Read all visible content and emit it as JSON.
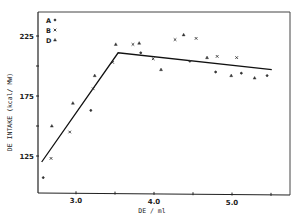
{
  "chart_data": {
    "type": "scatter",
    "title": "",
    "xlabel": "DE / ml",
    "ylabel": "DE INTAKE (kcal/ MW)",
    "xlim": [
      2.5,
      5.65
    ],
    "ylim": [
      96,
      244
    ],
    "x_ticks": [
      3.0,
      3.5,
      4.0,
      4.5,
      5.0,
      5.5
    ],
    "x_tick_labels": [
      "3.0",
      "",
      "4.0",
      "",
      "5.0",
      ""
    ],
    "y_ticks": [
      125,
      150,
      175,
      200,
      225
    ],
    "y_tick_labels": [
      "125",
      "",
      "175",
      "",
      "225"
    ],
    "grid": false,
    "legend_position": "upper-left",
    "legend": [
      {
        "label": "A",
        "marker": "dot"
      },
      {
        "label": "B",
        "marker": "cross"
      },
      {
        "label": "D",
        "marker": "triangle"
      }
    ],
    "series": [
      {
        "name": "A",
        "marker": "dot",
        "points": [
          [
            2.58,
            107
          ],
          [
            3.19,
            163
          ],
          [
            3.83,
            211
          ],
          [
            4.46,
            204
          ],
          [
            4.79,
            195
          ],
          [
            5.12,
            194
          ],
          [
            5.45,
            192
          ]
        ]
      },
      {
        "name": "B",
        "marker": "cross",
        "points": [
          [
            2.68,
            123
          ],
          [
            2.92,
            145
          ],
          [
            3.22,
            181
          ],
          [
            3.47,
            203
          ],
          [
            3.73,
            218
          ],
          [
            3.99,
            206
          ],
          [
            4.27,
            222
          ],
          [
            4.54,
            223
          ],
          [
            4.81,
            208
          ],
          [
            5.06,
            207
          ]
        ]
      },
      {
        "name": "D",
        "marker": "triangle",
        "points": [
          [
            2.69,
            150
          ],
          [
            2.96,
            169
          ],
          [
            3.24,
            192
          ],
          [
            3.51,
            218
          ],
          [
            3.81,
            219
          ],
          [
            4.09,
            197
          ],
          [
            4.38,
            226
          ],
          [
            4.68,
            207
          ],
          [
            4.99,
            192
          ],
          [
            5.29,
            190
          ]
        ]
      }
    ],
    "fit_line": {
      "type": "broken-stick",
      "points": [
        [
          2.56,
          120
        ],
        [
          3.54,
          211
        ],
        [
          5.51,
          197
        ]
      ]
    }
  }
}
